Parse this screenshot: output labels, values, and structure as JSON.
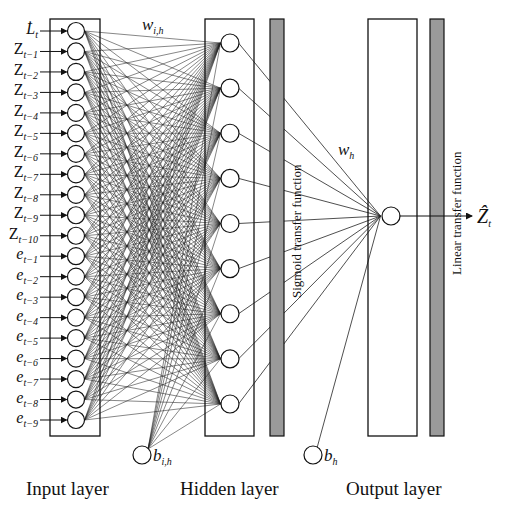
{
  "diagram": {
    "type": "feedforward-neural-network",
    "colors": {
      "stroke": "#111111",
      "bar_fill": "#9a9a9a",
      "background": "#ffffff"
    },
    "input_layer": {
      "name": "Input layer",
      "nodes": [
        {
          "base": "L̇",
          "sub": "t"
        },
        {
          "base": "Z",
          "sub": "t−1"
        },
        {
          "base": "Z",
          "sub": "t−2"
        },
        {
          "base": "Z",
          "sub": "t−3"
        },
        {
          "base": "Z",
          "sub": "t−4"
        },
        {
          "base": "Z",
          "sub": "t−5"
        },
        {
          "base": "Z",
          "sub": "t−6"
        },
        {
          "base": "Z",
          "sub": "t−7"
        },
        {
          "base": "Z",
          "sub": "t−8"
        },
        {
          "base": "Z",
          "sub": "t−9"
        },
        {
          "base": "Z",
          "sub": "t−10"
        },
        {
          "base": "e",
          "sub": "t−1"
        },
        {
          "base": "e",
          "sub": "t−2"
        },
        {
          "base": "e",
          "sub": "t−3"
        },
        {
          "base": "e",
          "sub": "t−4"
        },
        {
          "base": "e",
          "sub": "t−5"
        },
        {
          "base": "e",
          "sub": "t−6"
        },
        {
          "base": "e",
          "sub": "t−7"
        },
        {
          "base": "e",
          "sub": "t−8"
        },
        {
          "base": "e",
          "sub": "t−9"
        }
      ]
    },
    "hidden_layer": {
      "name": "Hidden layer",
      "node_count": 9,
      "transfer_function": "Sigmoid transfer function",
      "weight_label": {
        "base": "w",
        "sub": "i,h"
      },
      "bias_label": {
        "base": "b",
        "sub": "i,h"
      }
    },
    "output_layer": {
      "name": "Output layer",
      "node_count": 1,
      "transfer_function": "Linear transfer function",
      "weight_label": {
        "base": "w",
        "sub": "h"
      },
      "bias_label": {
        "base": "b",
        "sub": "h"
      },
      "output_label": {
        "base": "Ẑ",
        "sub": "t"
      }
    }
  }
}
